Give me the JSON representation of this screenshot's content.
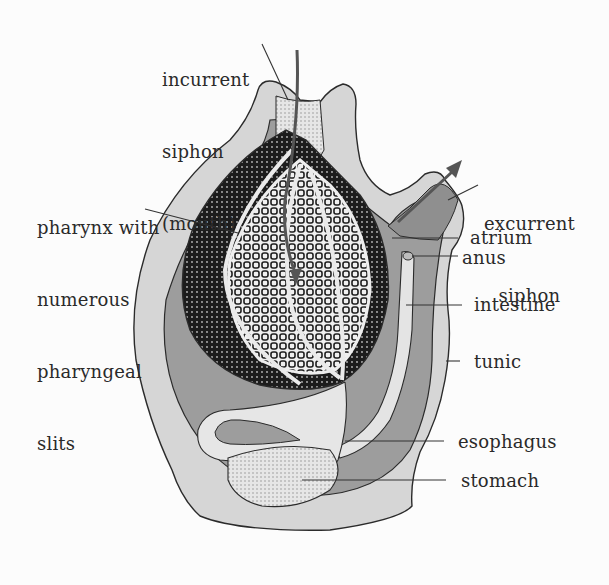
{
  "figure": {
    "colors": {
      "background": "#fcfcfc",
      "tunic": "#d6d6d6",
      "atrium": "#9d9d9d",
      "pharynx_dark": "#1e1e1e",
      "gut": "#e4e4e4",
      "outline": "#2b2b2b",
      "label_text": "#2a2a2a"
    }
  },
  "labels": {
    "incurrent_siphon": [
      "incurrent",
      "siphon",
      "(mouth)"
    ],
    "pharynx": [
      "pharynx with",
      "numerous",
      "pharyngeal",
      "slits"
    ],
    "excurrent_siphon": [
      "excurrent",
      "siphon"
    ],
    "atrium": "atrium",
    "anus": "anus",
    "intestine": "intestine",
    "tunic": "tunic",
    "esophagus": "esophagus",
    "stomach": "stomach"
  },
  "arrows": {
    "incurrent_flow": "water-in-arrow",
    "excurrent_flow": "water-out-arrow"
  }
}
